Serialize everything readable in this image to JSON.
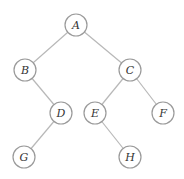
{
  "diagram": {
    "type": "binary-tree",
    "nodes": [
      {
        "id": "A",
        "label": "A",
        "x": 76,
        "y": 25
      },
      {
        "id": "B",
        "label": "B",
        "x": 25,
        "y": 70
      },
      {
        "id": "C",
        "label": "C",
        "x": 130,
        "y": 70
      },
      {
        "id": "D",
        "label": "D",
        "x": 61,
        "y": 113
      },
      {
        "id": "E",
        "label": "E",
        "x": 95,
        "y": 113
      },
      {
        "id": "F",
        "label": "F",
        "x": 163,
        "y": 113
      },
      {
        "id": "G",
        "label": "G",
        "x": 24,
        "y": 157
      },
      {
        "id": "H",
        "label": "H",
        "x": 130,
        "y": 157
      }
    ],
    "edges": [
      [
        "A",
        "B"
      ],
      [
        "A",
        "C"
      ],
      [
        "B",
        "D"
      ],
      [
        "C",
        "E"
      ],
      [
        "C",
        "F"
      ],
      [
        "D",
        "G"
      ],
      [
        "E",
        "H"
      ]
    ]
  }
}
